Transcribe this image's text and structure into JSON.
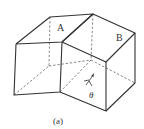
{
  "figure": {
    "caption": "(a)",
    "faces": {
      "a": {
        "label": "A"
      },
      "b": {
        "label": "B"
      }
    },
    "angle_label": "θ",
    "colors": {
      "line": "#333333",
      "hidden_line": "#555555",
      "background": "#ffffff"
    }
  }
}
